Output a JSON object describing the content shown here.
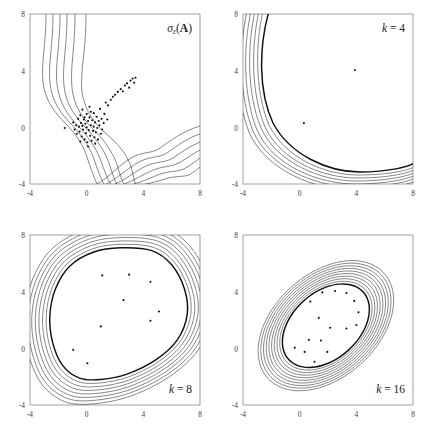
{
  "figure": {
    "background": "#ffffff",
    "line_color": "#3d3d3d",
    "thick_line_color": "#101010",
    "axis_color": "#8a8a8a",
    "dot_color": "#101010",
    "width": 425,
    "height": 442,
    "rows": 2,
    "cols": 2
  },
  "axes": {
    "xlim": [
      -4,
      8
    ],
    "ylim": [
      -4,
      8
    ],
    "xticks": [
      -4,
      0,
      4,
      8
    ],
    "yticks": [
      -4,
      0,
      4,
      8
    ],
    "xtick_labels": [
      "-4",
      "0",
      "4",
      "8"
    ],
    "ytick_labels": [
      "-4",
      "0",
      "4",
      "8"
    ],
    "grid": false
  },
  "chart_data": {
    "type": "line",
    "title": "",
    "xlabel": "",
    "ylabel": "",
    "panels": [
      {
        "id": "panel-sigma-eps-A",
        "label": "sigma_eps(A)",
        "label_parts": {
          "symbol": "σ",
          "subscript": "ε",
          "operand": "A",
          "open": "(",
          "close": ")"
        },
        "label_position": "top-right",
        "n_contours": 6,
        "has_thick_contour": false,
        "contour_style": "open curves entering from left edge and lower-right edge",
        "eigenvalues": [
          [
            -1.55,
            -0.05
          ],
          [
            -0.95,
            0.35
          ],
          [
            -0.85,
            -0.15
          ],
          [
            -0.75,
            0.15
          ],
          [
            -0.7,
            -0.45
          ],
          [
            -0.6,
            0.6
          ],
          [
            -0.55,
            0.05
          ],
          [
            -0.5,
            -0.3
          ],
          [
            -0.45,
            0.85
          ],
          [
            -0.4,
            0.3
          ],
          [
            -0.35,
            -0.65
          ],
          [
            -0.3,
            0.1
          ],
          [
            -0.3,
            1.25
          ],
          [
            -0.25,
            -0.15
          ],
          [
            -0.2,
            0.55
          ],
          [
            -0.15,
            -0.85
          ],
          [
            -0.1,
            0.25
          ],
          [
            -0.05,
            -0.4
          ],
          [
            0.0,
            0.95
          ],
          [
            0.0,
            0.0
          ],
          [
            0.05,
            -1.05
          ],
          [
            0.1,
            0.45
          ],
          [
            0.15,
            -0.2
          ],
          [
            0.2,
            1.45
          ],
          [
            0.2,
            0.7
          ],
          [
            0.25,
            -0.6
          ],
          [
            0.3,
            0.15
          ],
          [
            0.35,
            -0.95
          ],
          [
            0.4,
            0.5
          ],
          [
            0.45,
            -0.25
          ],
          [
            0.5,
            1.0
          ],
          [
            0.5,
            0.05
          ],
          [
            0.55,
            -0.7
          ],
          [
            0.6,
            0.35
          ],
          [
            0.65,
            -0.35
          ],
          [
            0.7,
            0.75
          ],
          [
            0.75,
            -0.05
          ],
          [
            0.8,
            -0.85
          ],
          [
            0.85,
            0.45
          ],
          [
            0.9,
            0.15
          ],
          [
            0.95,
            1.3
          ],
          [
            1.0,
            -0.45
          ],
          [
            1.05,
            0.6
          ],
          [
            1.1,
            -0.15
          ],
          [
            1.2,
            0.3
          ],
          [
            1.35,
            1.75
          ],
          [
            1.5,
            1.55
          ],
          [
            1.7,
            1.95
          ],
          [
            1.85,
            2.15
          ],
          [
            2.0,
            2.3
          ],
          [
            2.2,
            2.5
          ],
          [
            2.4,
            2.7
          ],
          [
            2.55,
            2.55
          ],
          [
            2.7,
            2.95
          ],
          [
            2.85,
            3.1
          ],
          [
            3.0,
            2.8
          ],
          [
            3.1,
            3.3
          ],
          [
            3.25,
            3.45
          ],
          [
            3.35,
            3.15
          ],
          [
            3.45,
            3.5
          ],
          [
            0.1,
            -1.35
          ],
          [
            -0.45,
            -1.0
          ],
          [
            0.6,
            -1.15
          ],
          [
            1.25,
            0.95
          ],
          [
            1.45,
            0.55
          ],
          [
            0.3,
            1.1
          ],
          [
            -0.15,
            0.7
          ]
        ]
      },
      {
        "id": "panel-k-4",
        "label": "k = 4",
        "label_parts": {
          "variable": "k",
          "relation": "=",
          "value": "4"
        },
        "label_position": "top-right",
        "n_contours": 7,
        "has_thick_contour": true,
        "contour_style": "large arc sweeping from upper-left edge around to lower-right edge",
        "eigenvalues": [
          [
            0.3,
            0.3
          ],
          [
            3.9,
            4.05
          ]
        ]
      },
      {
        "id": "panel-k-8",
        "label": "k = 8",
        "label_parts": {
          "variable": "k",
          "relation": "=",
          "value": "8"
        },
        "label_position": "bottom-right",
        "n_contours": 7,
        "has_thick_contour": true,
        "contour_style": "closed rounded blob, nested outer contours",
        "eigenvalues": [
          [
            1.1,
            5.15
          ],
          [
            3.0,
            5.2
          ],
          [
            4.5,
            4.7
          ],
          [
            5.1,
            2.6
          ],
          [
            4.5,
            1.95
          ],
          [
            1.0,
            1.55
          ],
          [
            -0.95,
            -0.1
          ],
          [
            0.05,
            -1.05
          ],
          [
            2.6,
            3.4
          ]
        ]
      },
      {
        "id": "panel-k-16",
        "label": "k = 16",
        "label_parts": {
          "variable": "k",
          "relation": "=",
          "value": "16"
        },
        "label_position": "bottom-right",
        "n_contours": 9,
        "has_thick_contour": true,
        "contour_style": "tilted closed ellipse, nested outer contours",
        "eigenvalues": [
          [
            1.6,
            3.95
          ],
          [
            2.5,
            4.05
          ],
          [
            3.3,
            3.9
          ],
          [
            0.75,
            3.3
          ],
          [
            3.85,
            3.35
          ],
          [
            4.15,
            2.55
          ],
          [
            1.35,
            2.15
          ],
          [
            4.0,
            1.65
          ],
          [
            2.15,
            1.45
          ],
          [
            3.3,
            1.4
          ],
          [
            0.65,
            0.6
          ],
          [
            1.5,
            0.55
          ],
          [
            0.35,
            -0.25
          ],
          [
            1.95,
            -0.25
          ],
          [
            1.05,
            -0.95
          ],
          [
            -0.35,
            0.05
          ]
        ]
      }
    ]
  }
}
